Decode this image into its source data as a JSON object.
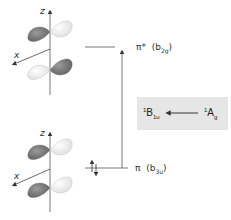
{
  "diagram": {
    "type": "molecular-orbital-energy-diagram",
    "levels": [
      {
        "id": "pi-star",
        "symbol": "π*",
        "symmetry": "b",
        "symmetry_sub": "2g",
        "occupancy": 0
      },
      {
        "id": "pi",
        "symbol": "π",
        "symmetry": "b",
        "symmetry_sub": "3u",
        "occupancy": 2
      }
    ],
    "orbitals": [
      {
        "id": "top-orbital",
        "axis_z": "z",
        "axis_x": "x"
      },
      {
        "id": "bottom-orbital",
        "axis_z": "z",
        "axis_x": "x"
      }
    ],
    "transition": {
      "from_sup": "1",
      "from": "A",
      "from_sub": "g",
      "to_sup": "1",
      "to": "B",
      "to_sub": "1u"
    },
    "colors": {
      "dark_lobe": "#7a7a7a",
      "light_lobe": "#f2f2f2",
      "line": "#555555",
      "box": "#e6e6e6"
    }
  }
}
